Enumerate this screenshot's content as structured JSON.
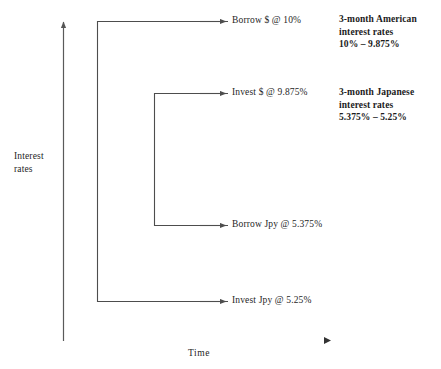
{
  "figure": {
    "type": "diagram",
    "title": "",
    "axes": {
      "y_label_line1": "Interest",
      "y_label_line2": "rates",
      "x_label": "Time"
    },
    "nodes": [
      {
        "id": "borrow-usd",
        "label": "Borrow $ @ 10%"
      },
      {
        "id": "invest-usd",
        "label": "Invest $ @ 9.875%"
      },
      {
        "id": "borrow-jpy",
        "label": "Borrow Jpy @ 5.375%"
      },
      {
        "id": "invest-jpy",
        "label": "Invest Jpy @ 5.25%"
      }
    ],
    "annotations": [
      {
        "id": "american",
        "line1": "3-month American",
        "line2": "interest rates",
        "line3": "10% – 9.875%"
      },
      {
        "id": "japanese",
        "line1": "3-month Japanese",
        "line2": "interest rates",
        "line3": "5.375% – 5.25%"
      }
    ],
    "colors": {
      "line": "#4d4d4d",
      "axis": "#5a5a5a",
      "text": "#262626"
    }
  }
}
